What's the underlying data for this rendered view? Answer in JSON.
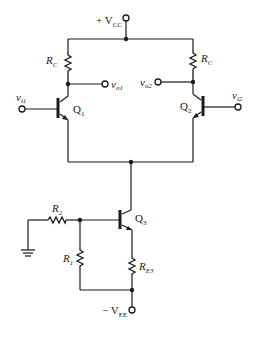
{
  "diagram": {
    "labels": {
      "vcc": "+ V",
      "vcc_sub": "CC",
      "vee": "− V",
      "vee_sub": "EE",
      "rc_left": "R",
      "rc_left_sub": "C",
      "rc_right": "R",
      "rc_right_sub": "C",
      "vo1": "v",
      "vo1_sub": "o1",
      "vo2": "v",
      "vo2_sub": "o2",
      "vi1": "v",
      "vi1_sub": "i1",
      "vi2": "v",
      "vi2_sub": "i2",
      "q1": "Q",
      "q1_sub": "1",
      "q2": "Q",
      "q2_sub": "2",
      "q3": "Q",
      "q3_sub": "3",
      "r1": "R",
      "r1_sub": "1",
      "r2": "R",
      "r2_sub": "2",
      "re3": "R",
      "re3_sub": "E3"
    },
    "components": [
      {
        "id": "Q1",
        "type": "npn-transistor"
      },
      {
        "id": "Q2",
        "type": "npn-transistor"
      },
      {
        "id": "Q3",
        "type": "npn-transistor"
      },
      {
        "id": "RC_left",
        "type": "resistor"
      },
      {
        "id": "RC_right",
        "type": "resistor"
      },
      {
        "id": "R1",
        "type": "resistor"
      },
      {
        "id": "R2",
        "type": "resistor"
      },
      {
        "id": "RE3",
        "type": "resistor"
      },
      {
        "id": "GND",
        "type": "ground"
      }
    ]
  }
}
